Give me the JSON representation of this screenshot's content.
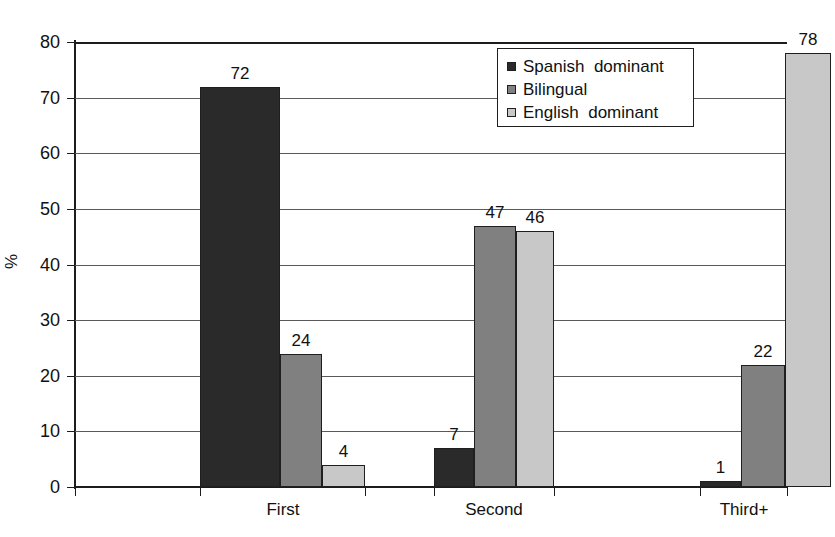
{
  "chart_data": {
    "type": "bar",
    "title": "",
    "subtitle": "",
    "xlabel": "",
    "ylabel": "%",
    "categories": [
      "First",
      "Second",
      "Third+"
    ],
    "series": [
      {
        "name": "Spanish  dominant",
        "color": "#2a2a2a",
        "values": [
          72,
          7,
          1
        ]
      },
      {
        "name": "Bilingual",
        "color": "#808080",
        "values": [
          24,
          47,
          22
        ]
      },
      {
        "name": "English  dominant",
        "color": "#c8c8c8",
        "values": [
          4,
          46,
          78
        ]
      }
    ],
    "ylim": [
      0,
      80
    ],
    "yticks": [
      0,
      10,
      20,
      30,
      40,
      50,
      60,
      70,
      80
    ],
    "ytick_labels": [
      "0",
      "10",
      "20",
      "30",
      "40",
      "50",
      "60",
      "70",
      "80"
    ],
    "grid": true,
    "grid_axis": "y",
    "legend_position": "top-right",
    "data_labels": true
  }
}
